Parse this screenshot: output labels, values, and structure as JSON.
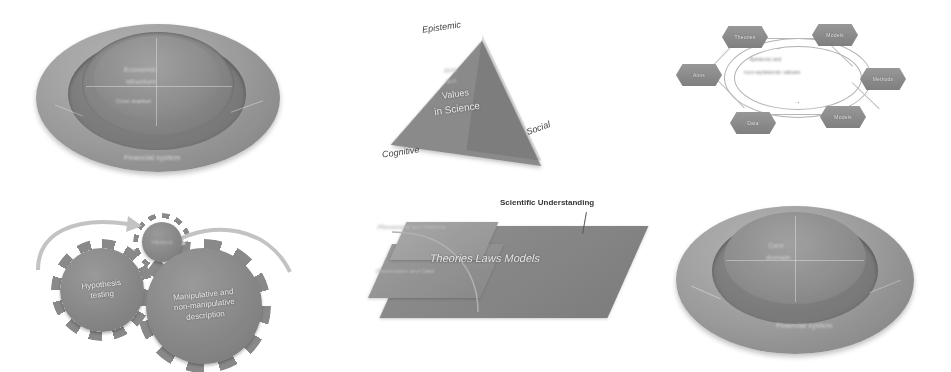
{
  "page": {
    "background_color": "#ffffff",
    "palette": {
      "fill_light": "#a2a2a2",
      "fill_mid": "#8b8b8b",
      "fill_dark": "#737373",
      "text_on_fill": "#f2f2f2",
      "text_on_white": "#3a3a3a"
    }
  },
  "figures": [
    {
      "id": "fig-1",
      "type": "concentric-oval",
      "position": "top-left",
      "outer_label": "Financial system",
      "rings": [
        "Financial system",
        "Institutional layer",
        "Core market"
      ],
      "center_lines": [
        "Economic",
        "structure"
      ]
    },
    {
      "id": "fig-2",
      "type": "triangle",
      "position": "top-center",
      "vertices": {
        "top": "Epistemic",
        "bottom_left": "Cognitive",
        "bottom_right": "Social"
      },
      "center_lines": [
        "Aims",
        "and",
        "Values",
        "in Science"
      ]
    },
    {
      "id": "fig-3",
      "type": "hexagon-cycle",
      "position": "top-right",
      "nodes": [
        "Theories",
        "Models",
        "Methods",
        "Data",
        "Values",
        "Aims"
      ],
      "center_lines": [
        "Epistemic and",
        "non-epistemic values"
      ],
      "arrows": [
        "cycle-arrow-top",
        "cycle-arrow-bottom"
      ]
    },
    {
      "id": "fig-4",
      "type": "gears",
      "position": "bottom-left",
      "gears": [
        {
          "label_lines": [
            "Hypothesis",
            "testing"
          ],
          "size": "medium"
        },
        {
          "label_lines": [
            "Manipulative and",
            "non-manipulative",
            "description"
          ],
          "size": "large"
        },
        {
          "label_lines": [
            "Inference"
          ],
          "size": "small"
        }
      ],
      "arrows": [
        "rotation-arrow-left",
        "rotation-arrow-right"
      ]
    },
    {
      "id": "fig-5",
      "type": "layered-plane",
      "position": "bottom-center",
      "callout": "Scientific Understanding",
      "slabs": [
        {
          "label": "Theories Laws Models",
          "layer": "top"
        },
        {
          "label": "Phenomena and Patterns",
          "layer": "upper-left"
        },
        {
          "label": "Observation and Data",
          "layer": "lower-left"
        }
      ]
    },
    {
      "id": "fig-6",
      "type": "concentric-oval",
      "position": "bottom-right",
      "outer_label": "Financial system",
      "rings": [
        "Financial system",
        "Market layer"
      ],
      "center_lines": [
        "Core",
        "domain"
      ]
    }
  ]
}
